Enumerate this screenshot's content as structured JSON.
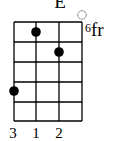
{
  "chord": {
    "name": "E",
    "base_fret_number": "6",
    "base_fret_suffix": "fr",
    "strings": 4,
    "frets_shown": 5,
    "open_strings": [
      4
    ],
    "dots": [
      {
        "string": 2,
        "fret": 1
      },
      {
        "string": 3,
        "fret": 2
      },
      {
        "string": 1,
        "fret": 4
      }
    ],
    "fingers": [
      {
        "string": 1,
        "label": "3"
      },
      {
        "string": 2,
        "label": "1"
      },
      {
        "string": 3,
        "label": "2"
      }
    ],
    "colors": {
      "line": "#000000",
      "dot": "#000000",
      "open": "#9a9a9a"
    }
  }
}
